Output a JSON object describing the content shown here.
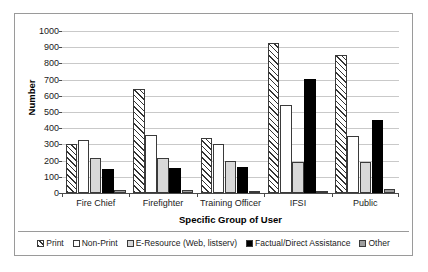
{
  "chart_data": {
    "type": "bar",
    "title": "",
    "xlabel": "Specific Group of User",
    "ylabel": "Number",
    "ylim": [
      0,
      1000
    ],
    "ytick_step": 100,
    "yticks": [
      1000,
      900,
      800,
      700,
      600,
      500,
      400,
      300,
      200,
      100,
      0
    ],
    "grid": true,
    "legend_position": "bottom",
    "categories": [
      "Fire Chief",
      "Firefighter",
      "Training Officer",
      "IFSI",
      "Public"
    ],
    "series": [
      {
        "name": "Print",
        "pattern": "diagonal-hatch",
        "color": "#ffffff",
        "values": [
          300,
          640,
          340,
          925,
          855
        ]
      },
      {
        "name": "Non-Print",
        "pattern": "solid-white",
        "color": "#ffffff",
        "values": [
          325,
          360,
          305,
          545,
          350
        ]
      },
      {
        "name": "E-Resource (Web, listserv)",
        "pattern": "light-gray",
        "color": "#d8d8d8",
        "values": [
          215,
          215,
          195,
          190,
          190
        ]
      },
      {
        "name": "Factual/Direct Assistance",
        "pattern": "solid-black",
        "color": "#000000",
        "values": [
          150,
          155,
          160,
          705,
          450
        ]
      },
      {
        "name": "Other",
        "pattern": "mid-gray",
        "color": "#9e9e9e",
        "values": [
          20,
          20,
          15,
          15,
          25
        ]
      }
    ]
  },
  "legend": {
    "items": [
      {
        "label": "Print"
      },
      {
        "label": "Non-Print"
      },
      {
        "label": "E-Resource (Web, listserv)"
      },
      {
        "label": "Factual/Direct Assistance"
      },
      {
        "label": "Other"
      }
    ]
  }
}
